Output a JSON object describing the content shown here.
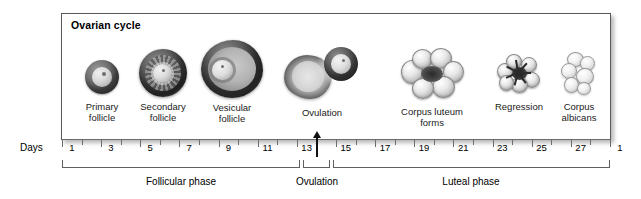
{
  "panel": {
    "title": "Ovarian cycle"
  },
  "stages": [
    {
      "name": "primary-follicle",
      "label": "Primary\nfollicle"
    },
    {
      "name": "secondary-follicle",
      "label": "Secondary\nfollicle"
    },
    {
      "name": "vesicular-follicle",
      "label": "Vesicular\nfollicle"
    },
    {
      "name": "ovulation",
      "label": "Ovulation"
    },
    {
      "name": "corpus-luteum",
      "label": "Corpus luteum\nforms"
    },
    {
      "name": "regression",
      "label": "Regression"
    },
    {
      "name": "corpus-albicans",
      "label": "Corpus\nalbicans"
    }
  ],
  "axis": {
    "caption": "Days",
    "labels": [
      "1",
      "3",
      "5",
      "7",
      "9",
      "11",
      "13",
      "15",
      "17",
      "19",
      "21",
      "23",
      "25",
      "27",
      "1"
    ],
    "tick_days": [
      1,
      2,
      3,
      4,
      5,
      6,
      7,
      8,
      9,
      10,
      11,
      12,
      13,
      14,
      15,
      16,
      17,
      18,
      19,
      20,
      21,
      22,
      23,
      24,
      25,
      26,
      27,
      28,
      29
    ],
    "ovulation_day": 14
  },
  "phases": [
    {
      "name": "follicular-phase",
      "label": "Follicular phase"
    },
    {
      "name": "ovulation-phase",
      "label": "Ovulation"
    },
    {
      "name": "luteal-phase",
      "label": "Luteal phase"
    }
  ],
  "colors": {
    "frame": "#5a5a5a",
    "axis": "#6b6b6b",
    "text": "#000000",
    "background": "#ffffff"
  },
  "chart_data": {
    "type": "table",
    "title": "Ovarian cycle",
    "xlabel": "Days",
    "x": [
      1,
      5,
      9,
      14,
      21,
      25,
      28
    ],
    "categories": [
      "Primary follicle",
      "Secondary follicle",
      "Vesicular follicle",
      "Ovulation",
      "Corpus luteum forms",
      "Regression",
      "Corpus albicans"
    ],
    "tick_labels": [
      "1",
      "3",
      "5",
      "7",
      "9",
      "11",
      "13",
      "15",
      "17",
      "19",
      "21",
      "23",
      "25",
      "27",
      "1"
    ],
    "xlim": [
      1,
      29
    ],
    "grid": false,
    "annotations": [
      "Follicular phase (days 1-13)",
      "Ovulation (day 14)",
      "Luteal phase (days 15-28)"
    ]
  }
}
